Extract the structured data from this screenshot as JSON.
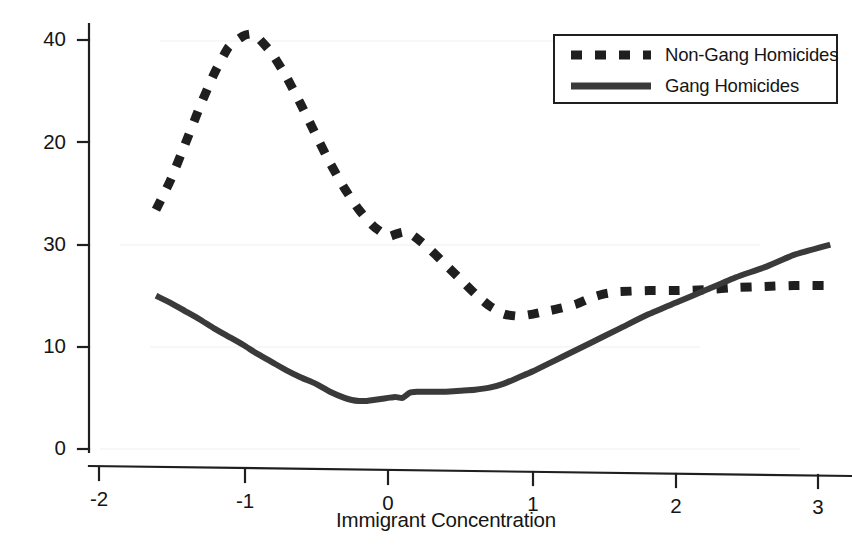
{
  "chart_data": {
    "type": "line",
    "title": "",
    "subtitle": "",
    "xlabel": "Immigrant Concentration",
    "ylabel": "1995 Homicide Rate (per 100,000)",
    "xlim": [
      -2.2,
      3.15
    ],
    "ylim": [
      0,
      42
    ],
    "xticks": [
      -2,
      -1,
      0,
      1,
      2,
      3
    ],
    "xtick_labels": [
      "-2",
      "-1",
      "0",
      "1",
      "2",
      "3"
    ],
    "yticks": [
      0,
      10,
      20,
      30,
      40
    ],
    "ytick_labels": [
      "0",
      "10",
      "20",
      "30",
      "40"
    ],
    "grid": false,
    "legend_position": "top-right",
    "series": [
      {
        "name": "Non-Gang Homicides",
        "style": "dashed",
        "color": "#1f1f1f",
        "x": [
          -1.6,
          -1.5,
          -1.4,
          -1.3,
          -1.2,
          -1.1,
          -1.0,
          -0.95,
          -0.9,
          -0.8,
          -0.7,
          -0.6,
          -0.5,
          -0.4,
          -0.3,
          -0.2,
          -0.1,
          0.0,
          0.05,
          0.1,
          0.15,
          0.2,
          0.3,
          0.4,
          0.5,
          0.6,
          0.7,
          0.8,
          0.9,
          1.0,
          1.1,
          1.2,
          1.3,
          1.4,
          1.5,
          1.6,
          1.8,
          2.0,
          2.2,
          2.4,
          2.6,
          2.8,
          3.05
        ],
        "y": [
          23.4,
          26.3,
          29.8,
          33.4,
          36.7,
          39.3,
          40.4,
          40.6,
          40.3,
          38.7,
          36.4,
          33.7,
          30.8,
          28.0,
          25.5,
          23.4,
          21.8,
          20.8,
          21.0,
          21.2,
          21.1,
          20.6,
          19.4,
          18.0,
          16.6,
          15.2,
          14.0,
          13.2,
          13.0,
          13.2,
          13.5,
          13.8,
          14.2,
          14.8,
          15.2,
          15.4,
          15.5,
          15.5,
          15.6,
          15.8,
          15.9,
          16.0,
          16.0
        ]
      },
      {
        "name": "Gang Homicides",
        "style": "solid",
        "color": "#3a3a3a",
        "x": [
          -1.6,
          -1.5,
          -1.4,
          -1.3,
          -1.2,
          -1.1,
          -1.0,
          -0.9,
          -0.8,
          -0.7,
          -0.6,
          -0.5,
          -0.4,
          -0.3,
          -0.25,
          -0.2,
          -0.15,
          -0.1,
          -0.05,
          0.0,
          0.05,
          0.1,
          0.15,
          0.2,
          0.25,
          0.3,
          0.35,
          0.4,
          0.5,
          0.6,
          0.7,
          0.8,
          0.9,
          1.0,
          1.1,
          1.2,
          1.4,
          1.6,
          1.8,
          2.0,
          2.2,
          2.4,
          2.6,
          2.8,
          3.05
        ],
        "y": [
          15.0,
          14.3,
          13.5,
          12.7,
          11.8,
          11.0,
          10.2,
          9.3,
          8.5,
          7.7,
          7.0,
          6.4,
          5.6,
          5.0,
          4.8,
          4.7,
          4.7,
          4.8,
          4.9,
          5.0,
          5.1,
          5.0,
          5.5,
          5.6,
          5.6,
          5.6,
          5.6,
          5.6,
          5.7,
          5.8,
          6.0,
          6.4,
          7.0,
          7.6,
          8.3,
          9.0,
          10.4,
          11.8,
          13.2,
          14.4,
          15.6,
          16.8,
          17.8,
          19.0,
          20.0
        ]
      }
    ],
    "legend": [
      {
        "label": "Non-Gang Homicides",
        "style": "dashed"
      },
      {
        "label": "Gang Homicides",
        "style": "solid"
      }
    ],
    "annotations": []
  },
  "axes": {
    "ylabel": "1995 Homicide Rate (per 100,000)",
    "xlabel": "Immigrant Concentration"
  },
  "colors": {
    "axis": "#1f1f1f",
    "series_non_gang": "#1f1f1f",
    "series_gang": "#3a3a3a",
    "background": "#ffffff"
  }
}
